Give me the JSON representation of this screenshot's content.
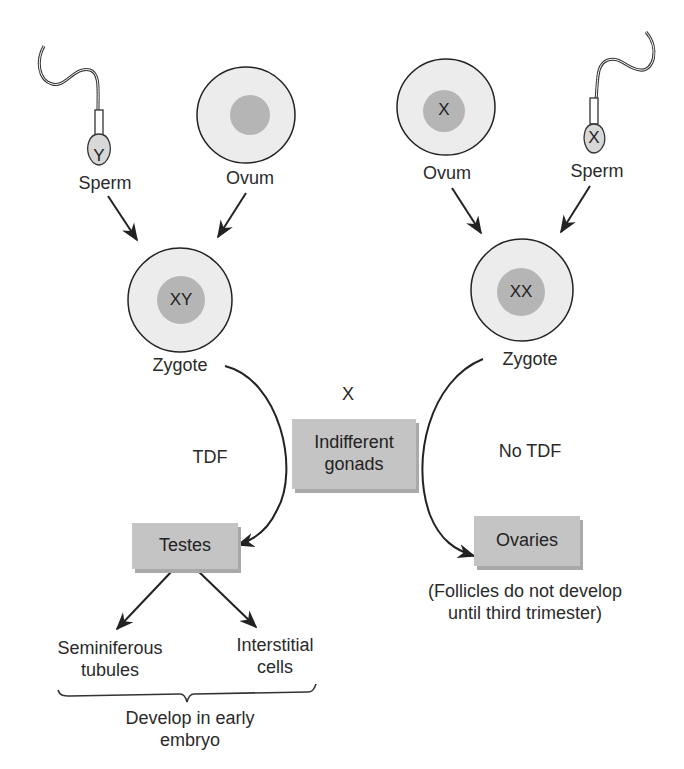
{
  "colors": {
    "cytoplasm": "#ececec",
    "nucleus": "#b5b5b5",
    "box_fill": "#c4c4c4",
    "box_shadow": "#a9a9a9",
    "outline": "#222222"
  },
  "left": {
    "sperm": {
      "label": "Sperm",
      "chromosome": "Y"
    },
    "ovum": {
      "label": "Ovum",
      "chromosome": ""
    },
    "zygote": {
      "label": "Zygote",
      "chromosomes": "XY"
    },
    "pathway_label": "TDF",
    "outcome": {
      "label": "Testes"
    },
    "products": [
      {
        "label_line1": "Seminiferous",
        "label_line2": "tubules"
      },
      {
        "label_line1": "Interstitial",
        "label_line2": "cells"
      }
    ],
    "brace_note": {
      "line1": "Develop in early",
      "line2": "embryo"
    }
  },
  "right": {
    "ovum": {
      "label": "Ovum",
      "chromosome": "X"
    },
    "sperm": {
      "label": "Sperm",
      "chromosome": "X"
    },
    "zygote": {
      "label": "Zygote",
      "chromosomes": "XX"
    },
    "pathway_label": "No TDF",
    "outcome": {
      "label": "Ovaries"
    },
    "note": {
      "line1": "(Follicles do not develop",
      "line2": "until third trimester)"
    }
  },
  "center": {
    "marker": "X",
    "gonads": {
      "line1": "Indifferent",
      "line2": "gonads"
    }
  }
}
